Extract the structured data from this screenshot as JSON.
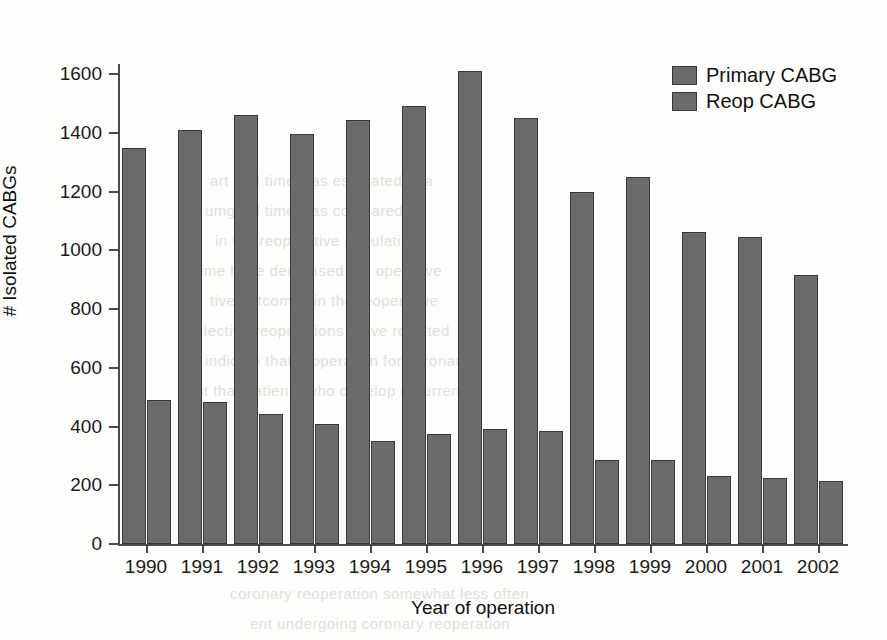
{
  "chart_data": {
    "type": "bar",
    "title": "",
    "xlabel": "Year of operation",
    "ylabel": "# Isolated CABGs",
    "categories": [
      "1990",
      "1991",
      "1992",
      "1993",
      "1994",
      "1995",
      "1996",
      "1997",
      "1998",
      "1999",
      "2000",
      "2001",
      "2002"
    ],
    "series": [
      {
        "name": "Primary CABG",
        "color": "#6b6b6b",
        "values": [
          1348,
          1410,
          1462,
          1397,
          1445,
          1490,
          1610,
          1450,
          1200,
          1250,
          1062,
          1045,
          915
        ]
      },
      {
        "name": "Reop CABG",
        "color": "#6b6b6b",
        "values": [
          490,
          482,
          443,
          410,
          350,
          375,
          390,
          385,
          285,
          285,
          230,
          225,
          215
        ]
      }
    ],
    "ylim": [
      0,
      1700
    ],
    "yticks": [
      0,
      200,
      400,
      600,
      800,
      1000,
      1200,
      1400,
      1600
    ],
    "ytick_labels": [
      "0",
      "200",
      "400",
      "600",
      "800",
      "1000",
      "1200",
      "1400",
      "1600"
    ],
    "grid": false,
    "legend_position": "top-right"
  },
  "legend": {
    "entries": [
      {
        "label": "Primary CABG"
      },
      {
        "label": "Reop CABG"
      }
    ]
  },
  "background_text": [
    "art and time was estimated in a",
    "umgical time was compared by",
    "in the reoperative population",
    "ime have decreased the operative",
    "tive outcomes in the reoperative",
    "elective reoperations, have resulted",
    "indicate that reoperation for coronary",
    "it that patients who develop recurrent",
    "coronary reoperation somewhat less often",
    "ent undergoing coronary reoperation"
  ]
}
